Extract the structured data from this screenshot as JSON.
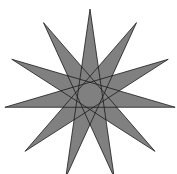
{
  "figure": {
    "type": "star-polygon",
    "schlafli": "{11/5}",
    "points": 11,
    "step": 5,
    "center": [
      90,
      95
    ],
    "radius": 86,
    "rotation_deg": -90,
    "fill": "#808080",
    "stroke": "#1a1a1a",
    "stroke_width": 0.8,
    "background": "#ffffff"
  }
}
